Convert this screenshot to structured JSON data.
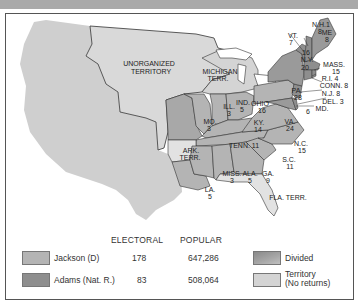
{
  "map": {
    "regions": {
      "unorganized": "UNORGANIZED\nTERRITORY",
      "unorganized_l1": "UNORGANIZED",
      "unorganized_l2": "TERRITORY",
      "michigan_l1": "MICHIGAN",
      "michigan_l2": "TERR.",
      "ark_l1": "ARK.",
      "ark_l2": "TERR.",
      "fla": "FLA. TERR."
    },
    "states": [
      {
        "abbr": "ME",
        "votes": "8",
        "extra": "1",
        "winner": "divided"
      },
      {
        "abbr": "N.H.",
        "votes": "8",
        "winner": "adams"
      },
      {
        "abbr": "VT.",
        "votes": "7",
        "winner": "adams"
      },
      {
        "abbr": "MASS.",
        "votes": "15",
        "winner": "adams"
      },
      {
        "abbr": "R.I.",
        "votes": "4",
        "winner": "adams"
      },
      {
        "abbr": "CONN.",
        "votes": "8",
        "winner": "adams"
      },
      {
        "abbr": "N.Y.",
        "votes": "20",
        "extra": "16",
        "winner": "divided"
      },
      {
        "abbr": "N.J.",
        "votes": "8",
        "winner": "adams"
      },
      {
        "abbr": "DEL.",
        "votes": "3",
        "winner": "adams"
      },
      {
        "abbr": "MD.",
        "votes": "6",
        "winner": "divided"
      },
      {
        "abbr": "PA.",
        "votes": "28",
        "winner": "jackson"
      },
      {
        "abbr": "OHIO",
        "votes": "16",
        "winner": "jackson"
      },
      {
        "abbr": "IND.",
        "votes": "5",
        "winner": "jackson"
      },
      {
        "abbr": "ILL.",
        "votes": "3",
        "winner": "jackson"
      },
      {
        "abbr": "MO.",
        "votes": "3",
        "winner": "jackson"
      },
      {
        "abbr": "KY.",
        "votes": "14",
        "winner": "jackson"
      },
      {
        "abbr": "VA.",
        "votes": "24",
        "winner": "jackson"
      },
      {
        "abbr": "N.C.",
        "votes": "15",
        "winner": "jackson"
      },
      {
        "abbr": "TENN.",
        "votes": "11",
        "winner": "jackson"
      },
      {
        "abbr": "S.C.",
        "votes": "11",
        "winner": "jackson"
      },
      {
        "abbr": "GA.",
        "votes": "9",
        "winner": "jackson"
      },
      {
        "abbr": "ALA.",
        "votes": "5",
        "winner": "jackson"
      },
      {
        "abbr": "MISS.",
        "votes": "3",
        "winner": "jackson"
      },
      {
        "abbr": "LA.",
        "votes": "5",
        "winner": "jackson"
      }
    ],
    "labels": {
      "me": "ME",
      "me_v": "8",
      "me_x": "1",
      "nh": "N.H.",
      "nh_v": "8",
      "vt": "VT.",
      "vt_v": "7",
      "mass": "MASS.",
      "mass_v": "15",
      "ri": "R.I. 4",
      "conn": "CONN. 8",
      "ny": "N.Y.",
      "ny_v": "20",
      "ny_x": "16",
      "nj": "N.J. 8",
      "del": "DEL. 3",
      "md": "MD.",
      "md_v": "6",
      "pa": "PA.",
      "pa_v": "28",
      "ohio": "OHIO",
      "ohio_v": "16",
      "ind": "IND.",
      "ind_v": "5",
      "ill": "ILL.",
      "ill_v": "3",
      "mo": "MO.",
      "mo_v": "3",
      "ky": "KY.",
      "ky_v": "14",
      "va": "VA.",
      "va_v": "24",
      "nc": "N.C.",
      "nc_v": "15",
      "tenn": "TENN. 11",
      "sc": "S.C.",
      "sc_v": "11",
      "ga": "GA.",
      "ga_v": "9",
      "ala": "ALA.",
      "ala_v": "5",
      "miss": "MISS.",
      "miss_v": "3",
      "la": "LA.",
      "la_v": "5"
    }
  },
  "legend": {
    "col_electoral": "ELECTORAL",
    "col_popular": "POPULAR",
    "rows": [
      {
        "name": "Jackson (D)",
        "electoral": "178",
        "popular": "647,286",
        "color": "#b4b4b4"
      },
      {
        "name": "Adams (Nat. R.)",
        "electoral": "83",
        "popular": "508,064",
        "color": "#8e8e8e"
      }
    ],
    "divided": "Divided",
    "territory_l1": "Territory",
    "territory_l2": "(No returns)",
    "colors": {
      "divided": "#9a9a9a",
      "territory": "#d4d4d4",
      "west": "#cfcfcf"
    }
  }
}
